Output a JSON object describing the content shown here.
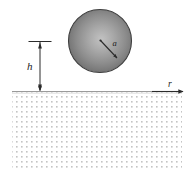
{
  "figure": {
    "type": "technical-line-diagram",
    "canvas": {
      "width": 190,
      "height": 178,
      "background": "#ffffff"
    }
  },
  "labels": {
    "radius": "a",
    "height": "h",
    "axis": "r"
  },
  "sphere": {
    "name": "shaded-sphere",
    "center_x": 100,
    "center_y": 41,
    "radius": 32,
    "outline_color": "#3a3a3a",
    "fill_dark": "#6e6e6e",
    "fill_light": "#b9b9b9",
    "highlight_x": 100,
    "highlight_y": 40
  },
  "radius_arrow": {
    "name": "radius-arrow",
    "from_x": 100,
    "from_y": 40,
    "to_x": 118,
    "to_y": 59,
    "color": "#2b2b2b",
    "label_x": 114,
    "label_y": 43
  },
  "height_dimension": {
    "name": "height-dimension",
    "line_x": 40,
    "top_y": 41,
    "bottom_y": 91,
    "tick_left_x": 29,
    "tick_right_x": 51,
    "color": "#2b2b2b",
    "label_x": 30,
    "label_y": 68
  },
  "ground": {
    "name": "half-space-region",
    "surface_y": 91,
    "left_x": 12,
    "right_x": 182,
    "bottom_y": 168,
    "surface_line_color": "#8a8a8a",
    "stipple_color": "#c8c8c8",
    "stipple_spacing": 5
  },
  "axis": {
    "name": "r-axis",
    "start_x": 150,
    "end_x": 184,
    "y": 91,
    "arrow_color": "#2b2b2b",
    "label_x": 172,
    "label_y": 86
  },
  "colors": {
    "ink": "#2b2b2b",
    "sphere_mid": "#8f8f8f",
    "stipple": "#c8c8c8",
    "background": "#ffffff"
  }
}
